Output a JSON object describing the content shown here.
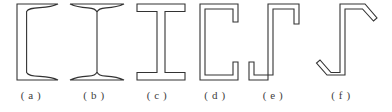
{
  "figure": {
    "background_color": "#ffffff",
    "stroke_color": "#333333",
    "label_color": "#3d3d3d",
    "caption_style": "( x )"
  },
  "items": [
    {
      "key": "channel-tapered-flange",
      "label": "( a )",
      "name": "Channel with tapered flanges",
      "label_center_x": 31,
      "cell_left": 10,
      "cell_width": 60,
      "glyph": "C"
    },
    {
      "key": "i-beam-tapered-flange",
      "label": "( b )",
      "name": "I-beam with tapered flanges",
      "label_center_x": 94,
      "cell_left": 66,
      "cell_width": 62,
      "glyph": "I"
    },
    {
      "key": "wide-flange-beam",
      "label": "( c )",
      "name": "Wide flange I-beam with parallel flanges",
      "label_center_x": 157,
      "cell_left": 132,
      "cell_width": 58,
      "glyph": "I"
    },
    {
      "key": "lipped-channel",
      "label": "( d )",
      "name": "Cold-formed lipped channel",
      "label_center_x": 215,
      "cell_left": 196,
      "cell_width": 50,
      "glyph": "C"
    },
    {
      "key": "lipped-zed-section",
      "label": "( e )",
      "name": "Cold-formed zed section with straight lips",
      "label_center_x": 273,
      "cell_left": 246,
      "cell_width": 60,
      "glyph": "Z"
    },
    {
      "key": "inclined-lip-zed-section",
      "label": "( f )",
      "name": "Cold-formed zed section with inclined lips",
      "label_center_x": 341,
      "cell_left": 312,
      "cell_width": 70,
      "glyph": "Z"
    }
  ]
}
